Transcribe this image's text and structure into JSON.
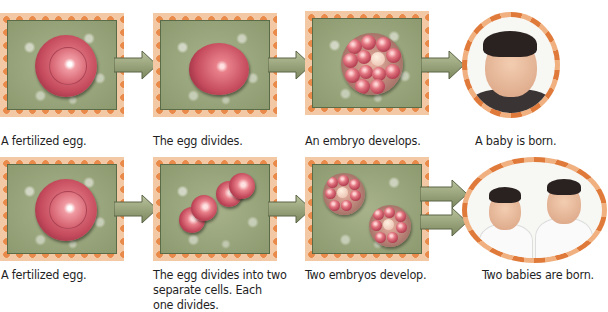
{
  "heading": "Identical Twins: Single Egg Division",
  "colors": {
    "panel_border_orange": "#e98a4a",
    "panel_bg_green": "#9aa67c",
    "egg_red": "#c44a5c",
    "arrow_green": "#8f9a72"
  },
  "rows": [
    {
      "steps": [
        {
          "caption": "A fertilized egg.",
          "image": "fertilized-egg"
        },
        {
          "caption": "The egg divides.",
          "image": "dividing-egg"
        },
        {
          "caption": "An embryo develops.",
          "image": "embryo-cluster"
        },
        {
          "caption": "A baby is born.",
          "image": "single-baby-photo"
        }
      ]
    },
    {
      "steps": [
        {
          "caption": "A fertilized egg.",
          "image": "fertilized-egg"
        },
        {
          "caption": "The egg divides into two separate cells. Each one divides.",
          "caption_lines": [
            "The egg divides into two",
            "separate cells. Each",
            "one divides."
          ],
          "image": "two-separate-cells"
        },
        {
          "caption": "Two embryos develop.",
          "image": "two-embryo-clusters"
        },
        {
          "caption": "Two babies are born.",
          "image": "twin-babies-photo"
        }
      ]
    }
  ]
}
